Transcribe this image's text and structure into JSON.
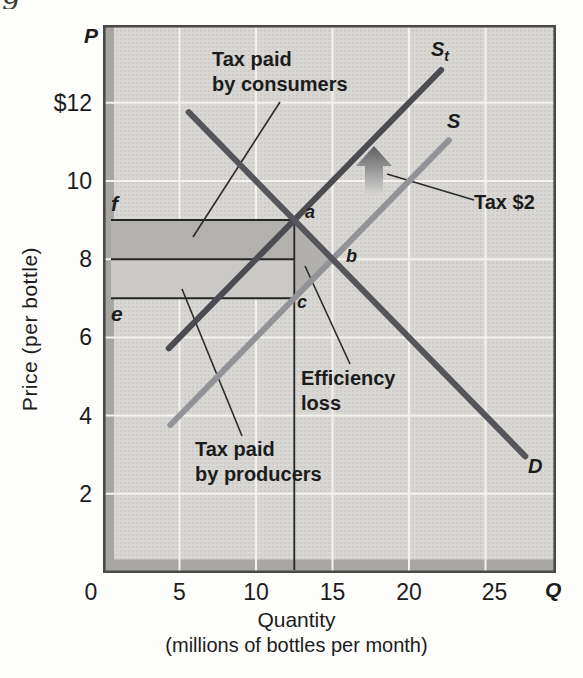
{
  "figure": {
    "caption_fragment": "g",
    "axes": {
      "y_symbol": "P",
      "x_symbol": "Q",
      "y_title": "Price (per bottle)",
      "x_title": "Quantity",
      "x_subtitle": "(millions of bottles per month)"
    }
  },
  "chart_data": {
    "type": "line",
    "title": "",
    "xlabel": "Quantity (millions of bottles per month)",
    "ylabel": "Price (per bottle)",
    "xlim": [
      0,
      29.6
    ],
    "ylim": [
      0,
      14
    ],
    "grid": true,
    "x_ticks": [
      "0",
      "5",
      "10",
      "15",
      "20",
      "25"
    ],
    "x_tick_values": [
      0,
      5,
      10,
      15,
      20,
      25
    ],
    "y_ticks": [
      "$12",
      "10",
      "8",
      "6",
      "4",
      "2"
    ],
    "y_tick_values": [
      12,
      10,
      8,
      6,
      4,
      2
    ],
    "series": [
      {
        "name": "supply-plus-tax",
        "label": "S",
        "sublabel": "t",
        "points": [
          [
            4.3,
            5.72
          ],
          [
            22.1,
            12.84
          ]
        ],
        "color": "#4c4b52",
        "width": 6
      },
      {
        "name": "supply",
        "label": "S",
        "points": [
          [
            4.4,
            3.76
          ],
          [
            22.6,
            11.04
          ]
        ],
        "color": "#929399",
        "width": 6
      },
      {
        "name": "demand",
        "label": "D",
        "points": [
          [
            5.6,
            11.76
          ],
          [
            27.6,
            2.96
          ]
        ],
        "color": "#56555c",
        "width": 6
      }
    ],
    "key_points": [
      {
        "label": "a",
        "q": 12.5,
        "p": 9
      },
      {
        "label": "b",
        "q": 15,
        "p": 8
      },
      {
        "label": "c",
        "q": 12.5,
        "p": 7
      }
    ],
    "axis_point_labels": [
      {
        "label": "f",
        "p": 9
      },
      {
        "label": "e",
        "p": 7
      }
    ],
    "reference_prices": [
      9,
      8,
      7
    ],
    "equilibrium_quantity_line": 12.5,
    "regions": [
      {
        "name": "tax-paid-by-consumers",
        "label": "Tax paid\nby consumers",
        "p_top": 9,
        "p_bottom": 8,
        "q_left": 0,
        "q_right": 12.5,
        "color": "#b3b1ad"
      },
      {
        "name": "tax-paid-by-producers",
        "label": "Tax paid\nby producers",
        "p_top": 8,
        "p_bottom": 7,
        "q_left": 0,
        "q_right": 12.5,
        "color": "#cbc9c5"
      },
      {
        "name": "efficiency-loss",
        "label": "Efficiency\nloss",
        "vertices": [
          [
            12.5,
            9
          ],
          [
            15,
            8
          ],
          [
            12.5,
            7
          ]
        ],
        "color": "#b2b0ac"
      }
    ],
    "annotations": [
      {
        "name": "tax-arrow-label",
        "text": "Tax $2"
      },
      {
        "name": "supply-shift-arrow",
        "icon": "up-arrow"
      }
    ]
  },
  "colors": {
    "plot_bg": "#d8d7d3",
    "shadow_band": "#a8a6a3",
    "border": "#4a4947",
    "gridline": "#f3f2ef",
    "thin_line": "#262626",
    "pointer_line": "#2b2b2b",
    "arrow_top": "#5e5e62",
    "arrow_bottom": "#d7d6d3"
  }
}
